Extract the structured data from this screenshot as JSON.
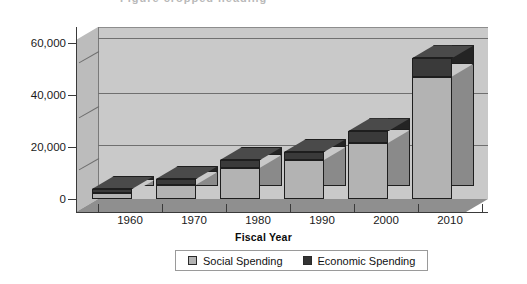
{
  "chart_data": {
    "type": "bar",
    "subtype": "stacked-column-3d",
    "title": "",
    "xlabel": "Fiscal Year",
    "ylabel": "",
    "categories": [
      "1960",
      "1970",
      "1980",
      "1990",
      "2000",
      "2010"
    ],
    "series": [
      {
        "name": "Social Spending",
        "color": "#b3b3b3",
        "values": [
          2200,
          5500,
          12000,
          15000,
          21500,
          47000
        ]
      },
      {
        "name": "Economic Spending",
        "color": "#333333",
        "values": [
          1600,
          2200,
          3000,
          3000,
          4500,
          7000
        ]
      }
    ],
    "totals": [
      3800,
      7700,
      15000,
      18000,
      26000,
      54000
    ],
    "ylim": [
      0,
      66000
    ],
    "yticks": [
      0,
      20000,
      40000,
      60000
    ],
    "ytick_labels": [
      "0",
      "20,000",
      "40,000",
      "60,000"
    ],
    "grid": true,
    "legend_position": "bottom"
  },
  "axis": {
    "x_title": "Fiscal Year",
    "y_tick_labels": [
      "60,000",
      "40,000",
      "20,000",
      "0"
    ],
    "x_tick_labels": [
      "1960",
      "1970",
      "1980",
      "1990",
      "2000",
      "2010"
    ]
  },
  "legend": {
    "items": [
      {
        "label": "Social Spending",
        "color": "#b3b3b3"
      },
      {
        "label": "Economic Spending",
        "color": "#333333"
      }
    ]
  },
  "clipped_title": "Figure cropped heading"
}
